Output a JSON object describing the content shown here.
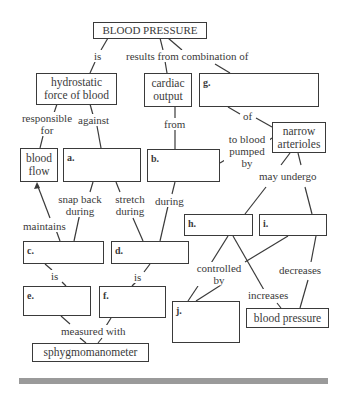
{
  "diagram": {
    "title": "BLOOD PRESSURE",
    "concept_boxes": {
      "root": "BLOOD PRESSURE",
      "hydrostatic": "hydrostatic force of blood",
      "cardiac_output": "cardiac output",
      "narrow_arterioles": "narrow arterioles",
      "blood_flow": "blood flow",
      "blood_pressure": "blood pressure",
      "sphygmomanometer": "sphygmomanometer"
    },
    "blank_boxes": {
      "a": "a.",
      "b": "b.",
      "c": "c.",
      "d": "d.",
      "e": "e.",
      "f": "f.",
      "g": "g.",
      "h": "h.",
      "i": "i.",
      "j": "j."
    },
    "link_labels": {
      "is_top": "is",
      "results_from": "results from combination of",
      "responsible_for": "responsible for",
      "against": "against",
      "from": "from",
      "of": "of",
      "to_blood_pumped_by": "to blood pumped by",
      "may_undergo": "may undergo",
      "snap_back_during": "snap back during",
      "stretch_during": "stretch during",
      "during": "during",
      "maintains": "maintains",
      "is_c": "is",
      "is_d": "is",
      "controlled_by": "controlled by",
      "increases": "increases",
      "decreases": "decreases",
      "measured_with": "measured with"
    },
    "colors": {
      "line": "#3a3a3a",
      "bar": "#9a9a9a"
    }
  }
}
